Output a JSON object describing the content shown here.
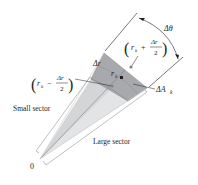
{
  "diagram": {
    "type": "polar-area-element",
    "labels": {
      "origin": "0",
      "small_sector": "Small sector",
      "large_sector": "Large sector",
      "delta_r": "Δr",
      "delta_theta": "Δθ",
      "delta_a": "ΔA",
      "delta_a_sub": "k",
      "r_k": "r",
      "r_k_sub": "k",
      "outer_radius": {
        "r": "r",
        "sub": "k",
        "op": "+",
        "num": "Δr",
        "den": "2"
      },
      "inner_radius": {
        "r": "r",
        "sub": "k",
        "op": "−",
        "num": "Δr",
        "den": "2"
      }
    },
    "colors": {
      "dark_region": "#a7a9ac",
      "light_sector": "#e3e4e5",
      "lines": "#231f20",
      "guide_lines": "#939598",
      "dot": "#231f20"
    }
  }
}
